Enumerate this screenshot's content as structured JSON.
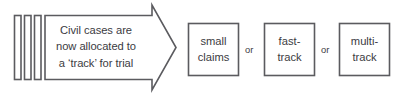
{
  "diagram": {
    "colors": {
      "stroke": "#5b5b5f",
      "text": "#3b3b3f",
      "background": "#ffffff"
    },
    "document_stack": {
      "name": "document-stack",
      "bar_count": 3
    },
    "arrow": {
      "name": "process-arrow",
      "direction": "right",
      "lines": [
        "Civil cases are",
        "now allocated to",
        "a ‘track’ for trial"
      ]
    },
    "outcomes": [
      {
        "id": "small-claims",
        "lines": [
          "small",
          "claims"
        ]
      },
      {
        "id": "fast-track",
        "lines": [
          "fast-",
          "track"
        ]
      },
      {
        "id": "multi-track",
        "lines": [
          "multi-",
          "track"
        ]
      }
    ],
    "connectors": [
      {
        "id": "or-1",
        "label": "or"
      },
      {
        "id": "or-2",
        "label": "or"
      }
    ]
  }
}
